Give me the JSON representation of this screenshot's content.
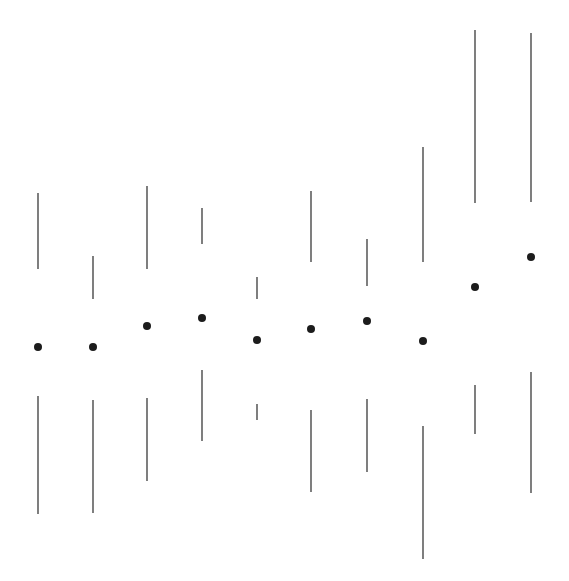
{
  "chart_data": {
    "type": "box",
    "style": "tufte-minimal-quartile-plot",
    "title": "",
    "xlabel": "",
    "ylabel": "",
    "grid": false,
    "axes_visible": false,
    "legend": null,
    "value_units": "pixel-height (581 - y), no axis shown",
    "ylim": [
      0,
      581
    ],
    "colors": {
      "line": "#3a3a3a",
      "dot": "#1c1c1c",
      "background": "#ffffff"
    },
    "categories": [
      "1",
      "2",
      "3",
      "4",
      "5",
      "6",
      "7",
      "8",
      "9",
      "10"
    ],
    "series": [
      {
        "name": "max",
        "values": [
          388,
          325,
          395,
          373,
          304,
          390,
          342,
          434,
          551,
          548
        ]
      },
      {
        "name": "upper_quartile",
        "values": [
          312,
          282,
          312,
          337,
          282,
          319,
          295,
          319,
          378,
          379
        ]
      },
      {
        "name": "median",
        "values": [
          234,
          234,
          255,
          263,
          241,
          252,
          260,
          240,
          294,
          324
        ]
      },
      {
        "name": "lower_quartile",
        "values": [
          185,
          181,
          183,
          211,
          177,
          171,
          182,
          155,
          196,
          209
        ]
      },
      {
        "name": "min",
        "values": [
          67,
          68,
          100,
          140,
          161,
          89,
          109,
          22,
          147,
          88
        ]
      }
    ],
    "pixel_layout": {
      "x": [
        38,
        93,
        147,
        202,
        257,
        311,
        367,
        423,
        475,
        531
      ],
      "top_start": [
        193,
        256,
        186,
        208,
        277,
        191,
        239,
        147,
        30,
        33
      ],
      "top_end": [
        269,
        299,
        269,
        244,
        299,
        262,
        286,
        262,
        203,
        202
      ],
      "dot_y": [
        347,
        347,
        326,
        318,
        340,
        329,
        321,
        341,
        287,
        257
      ],
      "bottom_start": [
        396,
        400,
        398,
        370,
        404,
        410,
        399,
        426,
        385,
        372
      ],
      "bottom_end": [
        514,
        513,
        481,
        441,
        420,
        492,
        472,
        559,
        434,
        493
      ],
      "dot_radius": 4
    }
  }
}
